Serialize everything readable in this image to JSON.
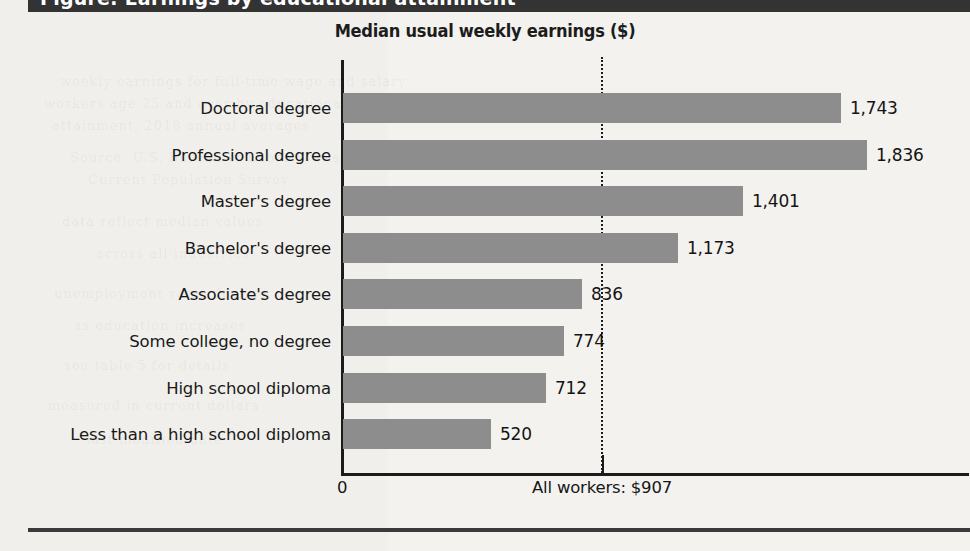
{
  "header": {
    "band_text_fragment": "Figure: Earnings by educational attainment"
  },
  "chart_data": {
    "type": "bar",
    "orientation": "horizontal",
    "title": "Median usual weekly earnings ($)",
    "xlabel": "",
    "ylabel": "",
    "xlim": [
      0,
      1900
    ],
    "grid": false,
    "legend": "none",
    "bar_color": "#8d8d8d",
    "axis_color": "#1b1b1b",
    "zero_tick_label": "0",
    "reference_line": {
      "label": "All workers: $907",
      "value": 907,
      "style": "dotted"
    },
    "categories": [
      "Doctoral degree",
      "Professional degree",
      "Master's degree",
      "Bachelor's degree",
      "Associate's degree",
      "Some college, no degree",
      "High school diploma",
      "Less than a high school diploma"
    ],
    "values": [
      1743,
      1836,
      1401,
      1173,
      836,
      774,
      712,
      520
    ],
    "value_labels": [
      "1,743",
      "1,836",
      "1,401",
      "1,173",
      "836",
      "774",
      "712",
      "520"
    ]
  },
  "ghost_text": [
    {
      "text": "weekly earnings for full-time wage and salary",
      "x": 60,
      "y": 74
    },
    {
      "text": "workers age 25 and over by educational",
      "x": 44,
      "y": 96
    },
    {
      "text": "attainment, 2018 annual averages",
      "x": 52,
      "y": 118
    },
    {
      "text": "Source: U.S. Bureau of Labor Statistics",
      "x": 70,
      "y": 150
    },
    {
      "text": "Current Population Survey",
      "x": 88,
      "y": 172
    },
    {
      "text": "data reflect median values",
      "x": 62,
      "y": 214
    },
    {
      "text": "across all industries",
      "x": 96,
      "y": 246
    },
    {
      "text": "unemployment rates decline",
      "x": 54,
      "y": 286
    },
    {
      "text": "as education increases",
      "x": 74,
      "y": 318
    },
    {
      "text": "see table 5 for details",
      "x": 64,
      "y": 358
    },
    {
      "text": "measured in current dollars",
      "x": 48,
      "y": 398
    },
    {
      "text": "last modified date",
      "x": 86,
      "y": 432
    }
  ]
}
